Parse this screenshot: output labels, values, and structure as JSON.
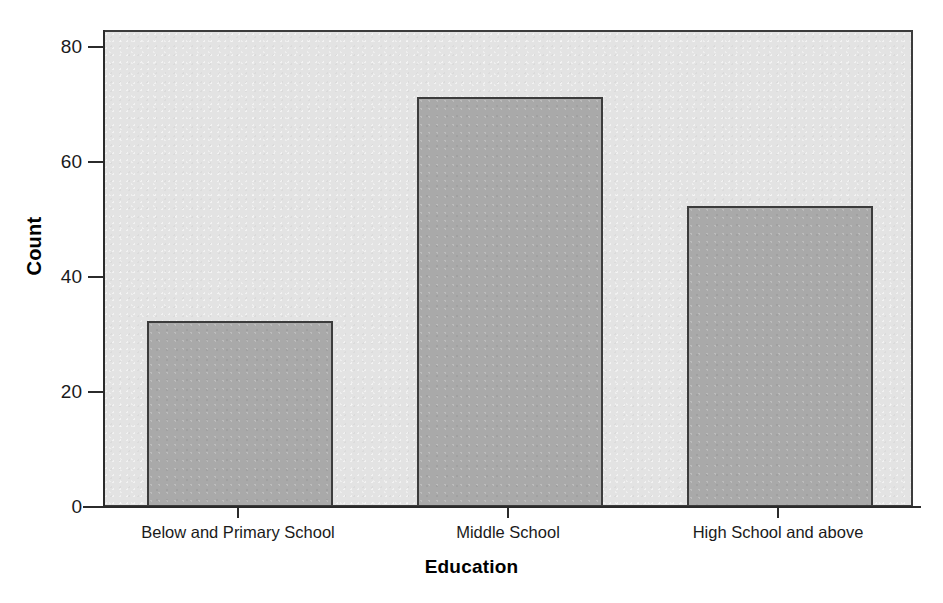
{
  "chart_data": {
    "type": "bar",
    "title": "",
    "subtitle": "",
    "xlabel": "Education",
    "ylabel": "Count",
    "categories": [
      "Below and Primary School",
      "Middle School",
      "High School and above"
    ],
    "values": [
      32,
      71,
      52
    ],
    "series": [
      {
        "name": "Count",
        "values": [
          32,
          71,
          52
        ]
      }
    ],
    "ylim": [
      0,
      83
    ],
    "yticks": [
      0,
      20,
      40,
      60,
      80
    ],
    "ytick_labels": [
      "0",
      "20",
      "40",
      "60",
      "80"
    ],
    "grid": false,
    "legend": false,
    "legend_position": "none",
    "bar_fill_color": "#a9a9a9",
    "bar_edge_color": "#3c3c3c",
    "panel_background_color": "#e3e3e3",
    "figure_background_color": "#ffffff",
    "axis_color": "#2b2b2b",
    "text_color": "#1a1a1a"
  },
  "axis": {
    "y_title": "Count",
    "x_title": "Education"
  }
}
